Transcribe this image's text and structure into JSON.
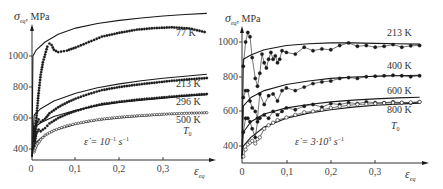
{
  "chart_data": [
    {
      "type": "line",
      "panel": "left",
      "title": "",
      "xlabel": "ε_eq",
      "ylabel": "σ_eq, MPa",
      "annotation": "ε̇ = 10⁻¹ s⁻¹",
      "xticks": [
        "0",
        "0,1",
        "0,2",
        "0,3"
      ],
      "yticks": [
        "400",
        "600",
        "800",
        "1000"
      ],
      "xlim": [
        0,
        0.42
      ],
      "ylim": [
        335,
        1290
      ],
      "grid": false,
      "legend": "inline labels at right end of curves",
      "curve_labels": [
        "77 K",
        "213 K",
        "296 K",
        "500 K",
        "T₀"
      ],
      "series": [
        {
          "name": "77 K model",
          "style": "line",
          "x": [
            0.0,
            0.002,
            0.01,
            0.03,
            0.06,
            0.1,
            0.15,
            0.2,
            0.25,
            0.3,
            0.35,
            0.4
          ],
          "y": [
            350,
            1000,
            1040,
            1090,
            1140,
            1180,
            1210,
            1230,
            1245,
            1258,
            1268,
            1275
          ]
        },
        {
          "name": "77 K experiment",
          "style": "dots",
          "x": [
            0.005,
            0.01,
            0.015,
            0.02,
            0.025,
            0.03,
            0.035,
            0.04,
            0.045,
            0.05,
            0.06,
            0.08,
            0.1,
            0.13,
            0.16,
            0.2,
            0.24,
            0.28,
            0.32,
            0.36,
            0.395
          ],
          "y": [
            480,
            600,
            760,
            880,
            960,
            1010,
            1060,
            1080,
            1070,
            1040,
            1025,
            1035,
            1055,
            1090,
            1125,
            1150,
            1170,
            1180,
            1185,
            1178,
            1155
          ]
        },
        {
          "name": "213 K model",
          "style": "line",
          "x": [
            0.0,
            0.005,
            0.02,
            0.05,
            0.1,
            0.15,
            0.2,
            0.25,
            0.3,
            0.35,
            0.4
          ],
          "y": [
            350,
            620,
            660,
            710,
            760,
            795,
            820,
            840,
            857,
            870,
            882
          ]
        },
        {
          "name": "213 K experiment",
          "style": "dots",
          "x": [
            0.005,
            0.01,
            0.015,
            0.02,
            0.03,
            0.04,
            0.06,
            0.08,
            0.1,
            0.13,
            0.16,
            0.2,
            0.24,
            0.28,
            0.32,
            0.36,
            0.4
          ],
          "y": [
            450,
            560,
            590,
            575,
            595,
            630,
            670,
            700,
            725,
            755,
            780,
            800,
            815,
            828,
            840,
            850,
            858
          ]
        },
        {
          "name": "296 K model",
          "style": "line",
          "x": [
            0.0,
            0.005,
            0.02,
            0.05,
            0.1,
            0.15,
            0.2,
            0.25,
            0.3,
            0.35,
            0.4
          ],
          "y": [
            350,
            540,
            570,
            610,
            650,
            680,
            700,
            715,
            728,
            740,
            750
          ]
        },
        {
          "name": "296 K experiment",
          "style": "dots",
          "x": [
            0.005,
            0.01,
            0.015,
            0.02,
            0.03,
            0.04,
            0.06,
            0.08,
            0.1,
            0.13,
            0.16,
            0.2,
            0.24,
            0.28,
            0.32,
            0.36,
            0.4
          ],
          "y": [
            420,
            500,
            525,
            515,
            535,
            565,
            600,
            625,
            645,
            670,
            690,
            705,
            718,
            728,
            738,
            747,
            755
          ]
        },
        {
          "name": "500 K model",
          "style": "line",
          "x": [
            0.0,
            0.005,
            0.02,
            0.05,
            0.1,
            0.15,
            0.2,
            0.25,
            0.3,
            0.35,
            0.4
          ],
          "y": [
            350,
            430,
            470,
            520,
            560,
            585,
            600,
            612,
            622,
            630,
            636
          ]
        },
        {
          "name": "500 K experiment",
          "style": "open-dots",
          "x": [
            0.005,
            0.01,
            0.02,
            0.03,
            0.05,
            0.08,
            0.1,
            0.13,
            0.16,
            0.2,
            0.24,
            0.28,
            0.32,
            0.36,
            0.4
          ],
          "y": [
            380,
            420,
            460,
            490,
            520,
            550,
            563,
            580,
            593,
            605,
            614,
            621,
            627,
            631,
            634
          ]
        }
      ]
    },
    {
      "type": "line",
      "panel": "right",
      "title": "",
      "xlabel": "ε_eq",
      "ylabel": "σ_eq, MPa",
      "annotation": "ε̇ = 3·10³ s⁻¹",
      "xticks": [
        "0",
        "0,1",
        "0,2",
        "0,3"
      ],
      "yticks": [
        "400",
        "600",
        "800",
        "1000"
      ],
      "xlim": [
        0,
        0.42
      ],
      "ylim": [
        320,
        1130
      ],
      "grid": false,
      "legend": "inline labels at right end of curves",
      "curve_labels": [
        "213 K",
        "400 K",
        "600 K",
        "800 K",
        "T₀"
      ],
      "series": [
        {
          "name": "213 K model",
          "style": "line",
          "x": [
            0.0,
            0.003,
            0.02,
            0.05,
            0.1,
            0.15,
            0.2,
            0.25,
            0.3,
            0.35,
            0.4
          ],
          "y": [
            330,
            900,
            925,
            955,
            980,
            990,
            995,
            995,
            992,
            990,
            988
          ]
        },
        {
          "name": "213 K experiment",
          "style": "dots-line",
          "x": [
            0.003,
            0.008,
            0.013,
            0.018,
            0.023,
            0.03,
            0.035,
            0.04,
            0.045,
            0.05,
            0.055,
            0.06,
            0.065,
            0.07,
            0.075,
            0.08,
            0.085,
            0.09,
            0.1,
            0.12,
            0.14,
            0.16,
            0.18,
            0.2,
            0.22,
            0.24,
            0.26,
            0.28,
            0.3,
            0.32,
            0.34,
            0.36,
            0.38,
            0.4
          ],
          "y": [
            860,
            1000,
            1055,
            1030,
            910,
            790,
            745,
            820,
            930,
            880,
            850,
            900,
            940,
            900,
            920,
            880,
            900,
            950,
            940,
            930,
            970,
            950,
            960,
            955,
            980,
            995,
            975,
            980,
            970,
            975,
            985,
            970,
            978,
            980
          ]
        },
        {
          "name": "400 K model",
          "style": "line",
          "x": [
            0.0,
            0.003,
            0.02,
            0.05,
            0.1,
            0.15,
            0.2,
            0.25,
            0.3,
            0.35,
            0.4
          ],
          "y": [
            330,
            630,
            680,
            720,
            755,
            775,
            790,
            798,
            803,
            806,
            808
          ]
        },
        {
          "name": "400 K experiment",
          "style": "dots-line",
          "x": [
            0.003,
            0.008,
            0.013,
            0.018,
            0.023,
            0.03,
            0.035,
            0.04,
            0.05,
            0.06,
            0.07,
            0.08,
            0.09,
            0.1,
            0.12,
            0.14,
            0.16,
            0.18,
            0.2,
            0.22,
            0.24,
            0.26,
            0.28,
            0.3,
            0.32,
            0.34,
            0.36,
            0.38,
            0.4
          ],
          "y": [
            680,
            720,
            720,
            660,
            620,
            600,
            560,
            700,
            640,
            690,
            700,
            660,
            720,
            735,
            720,
            740,
            760,
            770,
            775,
            790,
            795,
            790,
            800,
            803,
            805,
            808,
            805,
            800,
            805
          ]
        },
        {
          "name": "600 K model",
          "style": "line",
          "x": [
            0.0,
            0.003,
            0.02,
            0.05,
            0.1,
            0.15,
            0.2,
            0.25,
            0.3,
            0.35,
            0.4
          ],
          "y": [
            330,
            480,
            540,
            585,
            620,
            640,
            655,
            665,
            672,
            678,
            682
          ]
        },
        {
          "name": "600 K experiment",
          "style": "dots-line",
          "x": [
            0.003,
            0.008,
            0.013,
            0.018,
            0.023,
            0.03,
            0.035,
            0.04,
            0.05,
            0.06,
            0.07,
            0.08,
            0.09,
            0.1,
            0.12,
            0.14,
            0.16,
            0.18,
            0.2,
            0.22,
            0.24,
            0.26,
            0.28,
            0.3,
            0.32,
            0.34,
            0.36,
            0.38,
            0.4
          ],
          "y": [
            480,
            560,
            560,
            540,
            500,
            450,
            540,
            560,
            580,
            560,
            600,
            580,
            600,
            620,
            610,
            630,
            640,
            625,
            645,
            640,
            650,
            645,
            655,
            650,
            650,
            655,
            650,
            648,
            655
          ]
        },
        {
          "name": "800 K model",
          "style": "line",
          "x": [
            0.0,
            0.003,
            0.02,
            0.05,
            0.1,
            0.15,
            0.2,
            0.25,
            0.3,
            0.35,
            0.4
          ],
          "y": [
            330,
            400,
            450,
            510,
            560,
            590,
            610,
            625,
            635,
            642,
            648
          ]
        },
        {
          "name": "800 K experiment",
          "style": "open-dots-line",
          "x": [
            0.003,
            0.008,
            0.013,
            0.018,
            0.023,
            0.03,
            0.035,
            0.04,
            0.05,
            0.06,
            0.07,
            0.08,
            0.1,
            0.12,
            0.14,
            0.16,
            0.18,
            0.2,
            0.22,
            0.24,
            0.26,
            0.28,
            0.3,
            0.32,
            0.34,
            0.36,
            0.38,
            0.4
          ],
          "y": [
            340,
            380,
            410,
            420,
            430,
            415,
            440,
            450,
            500,
            520,
            535,
            550,
            565,
            580,
            595,
            600,
            610,
            620,
            628,
            635,
            640,
            642,
            645,
            648,
            650,
            650,
            652,
            655
          ]
        }
      ]
    }
  ],
  "figure": {
    "left": {
      "ylabel_sym": "σ",
      "ylabel_sub": "eq",
      "ylabel_unit": ", MPa",
      "xlabel_sym": "ε",
      "xlabel_sub": "eq",
      "rate_prefix": "ε̇ = 10",
      "rate_exp": "−1",
      "rate_unit": " s",
      "rate_unit_exp": "−1",
      "labels": {
        "k77": "77 K",
        "k213": "213 K",
        "k296": "296 K",
        "k500": "500 K",
        "t0": "T",
        "t0_sub": "0"
      },
      "yticks": [
        "1000",
        "800",
        "600",
        "400"
      ],
      "xticks": [
        "0",
        "0,1",
        "0,2",
        "0,3"
      ]
    },
    "right": {
      "ylabel_sym": "σ",
      "ylabel_sub": "eq",
      "ylabel_unit": ", MPa",
      "xlabel_sym": "ε",
      "xlabel_sub": "eq",
      "rate_prefix": "ε̇ = 3·10",
      "rate_exp": "3",
      "rate_unit": " s",
      "rate_unit_exp": "−1",
      "labels": {
        "k213": "213 K",
        "k400": "400 K",
        "k600": "600 K",
        "k800": "800 K",
        "t0": "T",
        "t0_sub": "0"
      },
      "yticks": [
        "1000",
        "800",
        "600",
        "400"
      ],
      "xticks": [
        "0",
        "0,1",
        "0,2",
        "0,3"
      ]
    },
    "colors": {
      "ink": "#1a1a1a",
      "text": "#333333",
      "bg": "#ffffff"
    }
  }
}
